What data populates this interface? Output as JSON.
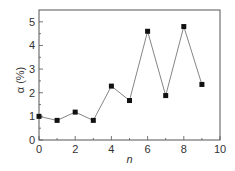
{
  "chart_data": {
    "type": "line",
    "title": "",
    "xlabel": "n",
    "ylabel": "α (%)",
    "xlim": [
      0,
      10
    ],
    "ylim": [
      0,
      5.5
    ],
    "xticks": [
      0,
      2,
      4,
      6,
      8,
      10
    ],
    "yticks": [
      0,
      1,
      2,
      3,
      4,
      5
    ],
    "grid": false,
    "legend": null,
    "marker": "square",
    "series": [
      {
        "name": "α",
        "x": [
          0,
          1,
          2,
          3,
          4,
          5,
          6,
          7,
          8,
          9
        ],
        "values": [
          1.0,
          0.83,
          1.18,
          0.83,
          2.28,
          1.67,
          4.6,
          1.88,
          4.8,
          2.35
        ]
      }
    ]
  },
  "colors": {
    "axis": "#555555",
    "line": "#777777",
    "marker": "#111111",
    "text": "#333333"
  }
}
